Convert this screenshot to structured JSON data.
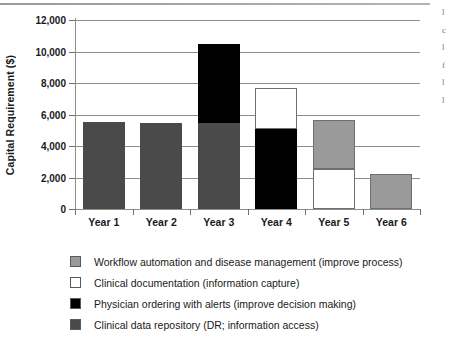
{
  "page": {
    "margin_text_lines": [
      "l",
      "c",
      "l",
      "f",
      "l",
      "l"
    ]
  },
  "chart_data": {
    "type": "bar",
    "stacked": true,
    "title": "",
    "xlabel": "",
    "ylabel": "Capital Requirement ($)",
    "ylim": [
      0,
      12000
    ],
    "ytick_values": [
      12000,
      10000,
      8000,
      6000,
      4000,
      2000,
      0
    ],
    "ytick_labels": [
      "12,000",
      "10,000",
      "8,000",
      "6,000",
      "4,000",
      "2,000",
      "0"
    ],
    "grid": true,
    "legend_position": "below",
    "categories": [
      "Year 1",
      "Year 2",
      "Year 3",
      "Year 4",
      "Year 5",
      "Year 6"
    ],
    "series": [
      {
        "name": "Workflow automation and disease management (improve process)",
        "color": "#9a9a9a",
        "values": [
          0,
          0,
          0,
          0,
          3100,
          2250
        ]
      },
      {
        "name": "Clinical documentation (information capture)",
        "color": "#ffffff",
        "values": [
          0,
          0,
          0,
          2600,
          2550,
          0
        ]
      },
      {
        "name": "Physician ordering with alerts (improve decision making)",
        "color": "#000000",
        "values": [
          0,
          0,
          5050,
          5100,
          0,
          0
        ]
      },
      {
        "name": "Clinical data repository (DR; information access)",
        "color": "#4a4a4a",
        "values": [
          5500,
          5450,
          5450,
          0,
          0,
          0
        ]
      }
    ],
    "totals": [
      5500,
      5450,
      10500,
      7700,
      5650,
      2250
    ]
  },
  "legend": {
    "items": [
      {
        "label": "Workflow automation and disease management (improve process)",
        "color": "#9a9a9a"
      },
      {
        "label": "Clinical documentation (information capture)",
        "color": "#ffffff"
      },
      {
        "label": "Physician ordering with alerts (improve decision making)",
        "color": "#000000"
      },
      {
        "label": "Clinical data repository (DR; information access)",
        "color": "#4a4a4a"
      }
    ]
  }
}
